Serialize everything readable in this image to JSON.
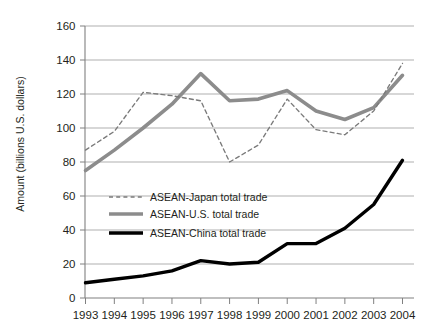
{
  "chart_data": {
    "type": "line",
    "title": "",
    "xlabel": "",
    "ylabel": "Amount (billions U.S. dollars)",
    "categories": [
      "1993",
      "1994",
      "1995",
      "1996",
      "1997",
      "1998",
      "1999",
      "2000",
      "2001",
      "2002",
      "2003",
      "2004"
    ],
    "x": [
      1993,
      1994,
      1995,
      1996,
      1997,
      1998,
      1999,
      2000,
      2001,
      2002,
      2003,
      2004
    ],
    "xlim": [
      1993,
      2004
    ],
    "ylim": [
      0,
      160
    ],
    "yticks": [
      0,
      20,
      40,
      60,
      80,
      100,
      120,
      140,
      160
    ],
    "xticks": [
      "1993",
      "1994",
      "1995",
      "1996",
      "1997",
      "1998",
      "1999",
      "2000",
      "2001",
      "2002",
      "2003",
      "2004"
    ],
    "grid": "horizontal",
    "legend_position": "center-left",
    "series": [
      {
        "name": "ASEAN-Japan total trade",
        "style": "dashed",
        "color": "#7a7a7a",
        "values": [
          87,
          98,
          121,
          119,
          116,
          80,
          90,
          117,
          99,
          96,
          110,
          138
        ]
      },
      {
        "name": "ASEAN-U.S. total trade",
        "style": "solid-thick-gray",
        "color": "#8c8c8c",
        "values": [
          75,
          87,
          100,
          114,
          132,
          116,
          117,
          122,
          110,
          105,
          112,
          131
        ]
      },
      {
        "name": "ASEAN-China total trade",
        "style": "solid-thick-black",
        "color": "#000000",
        "values": [
          9,
          11,
          13,
          16,
          22,
          20,
          21,
          32,
          32,
          41,
          55,
          81
        ]
      }
    ]
  },
  "legend": {
    "items": [
      {
        "label": "ASEAN-Japan total trade",
        "swatch": "dashed-gray-line"
      },
      {
        "label": "ASEAN-U.S. total trade",
        "swatch": "solid-gray-line"
      },
      {
        "label": "ASEAN-China total trade",
        "swatch": "solid-black-line"
      }
    ]
  },
  "colors": {
    "grid": "#a6a6a6",
    "axis": "#808080",
    "text": "#231f20",
    "japan": "#7a7a7a",
    "us": "#8c8c8c",
    "china": "#000000"
  }
}
